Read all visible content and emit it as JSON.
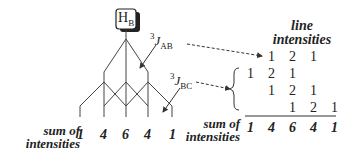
{
  "title_box": {
    "label": "H",
    "subscript": "B"
  },
  "couplings": [
    {
      "prefix": "3",
      "symbol": "J",
      "subscript": "AB"
    },
    {
      "prefix": "3",
      "symbol": "J",
      "subscript": "BC"
    }
  ],
  "tree_sum": {
    "label_line1": "sum of",
    "label_line2": "intensities",
    "values": [
      "1",
      "4",
      "6",
      "4",
      "1"
    ]
  },
  "table": {
    "header_line1": "line",
    "header_line2": "intensities",
    "row_ab": [
      "1",
      "2",
      "1"
    ],
    "rows_bc": [
      [
        "1",
        "2",
        "1"
      ],
      [
        "1",
        "2",
        "1"
      ],
      [
        "1",
        "2",
        "1"
      ]
    ],
    "sum_label_line1": "sum of",
    "sum_label_line2": "intensities",
    "sum_values": [
      "1",
      "4",
      "6",
      "4",
      "1"
    ]
  }
}
